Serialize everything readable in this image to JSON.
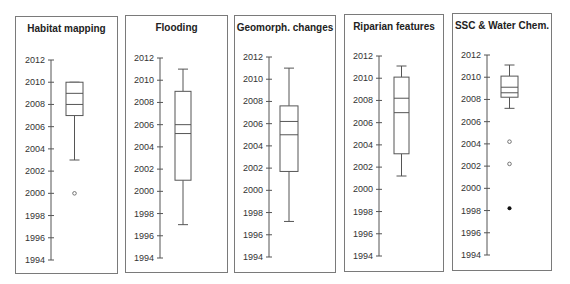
{
  "chart_data": [
    {
      "type": "box",
      "title": "Habitat mapping",
      "ylim": [
        1994,
        2012
      ],
      "yticks": [
        2012,
        2010,
        2008,
        2006,
        2004,
        2002,
        2000,
        1998,
        1996,
        1994
      ],
      "box": {
        "whisker_low": 2003,
        "q1": 2007,
        "median": 2008,
        "mean": 2009,
        "q3": 2010,
        "whisker_high": 2010
      },
      "outliers_open": [
        2000
      ],
      "outliers_filled": []
    },
    {
      "type": "box",
      "title": "Flooding",
      "ylim": [
        1994,
        2012
      ],
      "yticks": [
        2012,
        2010,
        2008,
        2006,
        2004,
        2002,
        2000,
        1998,
        1996,
        1994
      ],
      "box": {
        "whisker_low": 1997,
        "q1": 2001,
        "median": 2005.2,
        "mean": 2006,
        "q3": 2009,
        "whisker_high": 2011
      },
      "outliers_open": [],
      "outliers_filled": []
    },
    {
      "type": "box",
      "title": "Geomorph. changes",
      "ylim": [
        1994,
        2012
      ],
      "yticks": [
        2012,
        2010,
        2008,
        2006,
        2004,
        2002,
        2000,
        1998,
        1996,
        1994
      ],
      "box": {
        "whisker_low": 1997.2,
        "q1": 2001.7,
        "median": 2005,
        "mean": 2006.2,
        "q3": 2007.6,
        "whisker_high": 2011
      },
      "outliers_open": [],
      "outliers_filled": []
    },
    {
      "type": "box",
      "title": "Riparian features",
      "ylim": [
        1994,
        2012
      ],
      "yticks": [
        2012,
        2010,
        2008,
        2006,
        2004,
        2002,
        2000,
        1998,
        1996,
        1994
      ],
      "box": {
        "whisker_low": 2001.2,
        "q1": 2003.2,
        "median": 2006.9,
        "mean": 2008.2,
        "q3": 2010.1,
        "whisker_high": 2011.1
      },
      "outliers_open": [],
      "outliers_filled": []
    },
    {
      "type": "box",
      "title": "SSC & Water Chem.",
      "ylim": [
        1994,
        2012
      ],
      "yticks": [
        2012,
        2010,
        2008,
        2006,
        2004,
        2002,
        2000,
        1998,
        1996,
        1994
      ],
      "box": {
        "whisker_low": 2007.2,
        "q1": 2008.2,
        "median": 2008.6,
        "mean": 2009.1,
        "q3": 2010.1,
        "whisker_high": 2011.1
      },
      "outliers_open": [
        2004.2,
        2002.2
      ],
      "outliers_filled": [
        1998.2
      ]
    }
  ]
}
